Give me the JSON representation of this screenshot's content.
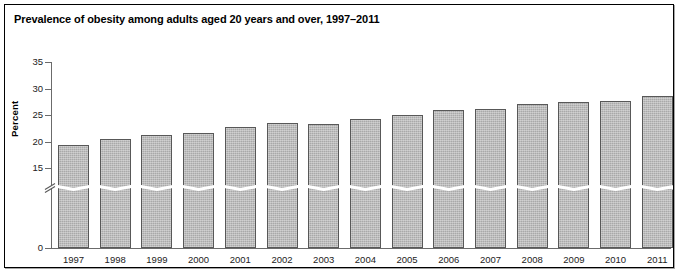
{
  "figure": {
    "title": "Prevalence of obesity among adults aged 20 years and over, 1997–2011",
    "ylabel": "Percent"
  },
  "chart_data": {
    "type": "bar",
    "title": "Prevalence of obesity among adults aged 20 years and over, 1997–2011",
    "xlabel": "",
    "ylabel": "Percent",
    "ylim": [
      0,
      35
    ],
    "yticks": [
      0,
      15,
      20,
      25,
      30,
      35
    ],
    "ytick_labels": [
      "0",
      "15",
      "20",
      "25",
      "30",
      "35"
    ],
    "axis_break": true,
    "axis_break_between": [
      0,
      15
    ],
    "grid": false,
    "legend": null,
    "bar_color": "#a9a9a9",
    "bar_edge_color": "#585858",
    "categories": [
      "1997",
      "1998",
      "1999",
      "2000",
      "2001",
      "2002",
      "2003",
      "2004",
      "2005",
      "2006",
      "2007",
      "2008",
      "2009",
      "2010",
      "2011"
    ],
    "values": [
      19.4,
      20.5,
      21.3,
      21.6,
      22.8,
      23.6,
      23.4,
      24.3,
      25.0,
      26.0,
      26.2,
      27.1,
      27.4,
      27.7,
      28.6
    ]
  }
}
